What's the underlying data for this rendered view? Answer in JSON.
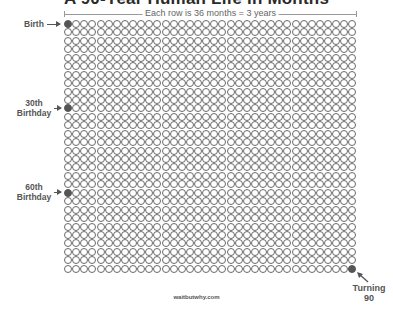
{
  "title": "A 90-Year Human Life in Months",
  "row_note": "Each row is 36 months = 3 years",
  "grid": {
    "columns": 36,
    "rows": 30,
    "total_months": 1080
  },
  "markers": {
    "birth": {
      "label": "Birth",
      "row": 0,
      "col": 0
    },
    "thirtieth": {
      "label_line1": "30th",
      "label_line2": "Birthday",
      "row": 10,
      "col": 0
    },
    "sixtieth": {
      "label_line1": "60th",
      "label_line2": "Birthday",
      "row": 20,
      "col": 0
    },
    "ninety": {
      "label_line1": "Turning",
      "label_line2": "90",
      "row": 29,
      "col": 35
    }
  },
  "colors": {
    "dot_outline": "#6a6a6a",
    "dot_fill": "#555555",
    "text": "#555555"
  },
  "footer": "waitbutwhy.com"
}
